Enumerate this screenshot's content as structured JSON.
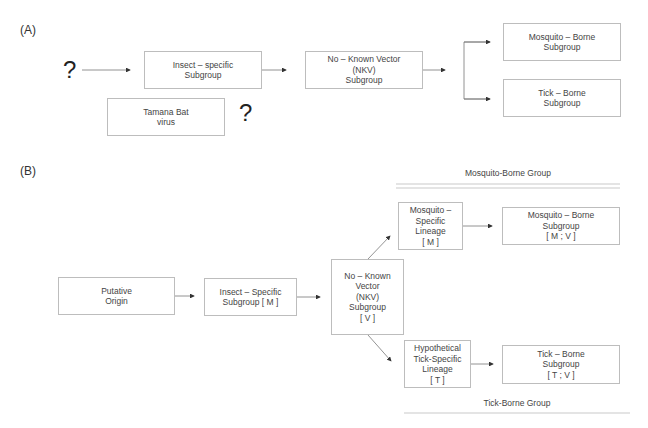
{
  "panel_a": {
    "label": "(A)",
    "unknown_origin": "?",
    "unknown_link": "?",
    "boxes": {
      "insect_specific": "Insect – specific\nSubgroup",
      "nkv": "No – Known Vector\n(NKV)\nSubgroup",
      "mosquito_borne": "Mosquito – Borne\nSubgroup",
      "tick_borne": "Tick – Borne\nSubgroup",
      "tamana": "Tamana Bat\nvirus"
    }
  },
  "panel_b": {
    "label": "(B)",
    "boxes": {
      "putative_origin": "Putative\nOrigin",
      "insect_specific": "Insect – Specific\nSubgroup [ M ]",
      "nkv": "No – Known\nVector\n(NKV)\nSubgroup\n[ V ]",
      "mosquito_specific": "Mosquito –\nSpecific\nLineage\n[ M ]",
      "mosquito_borne": "Mosquito – Borne\nSubgroup\n[ M ;  V ]",
      "tick_specific": "Hypothetical\nTick-Specific\nLineage\n[ T ]",
      "tick_borne": "Tick – Borne\nSubgroup\n[ T ; V ]"
    },
    "groups": {
      "mosquito": "Mosquito-Borne Group",
      "tick": "Tick-Borne Group"
    }
  },
  "colors": {
    "box_border": "#bdbdbd",
    "line": "#555555",
    "text": "#444444"
  }
}
